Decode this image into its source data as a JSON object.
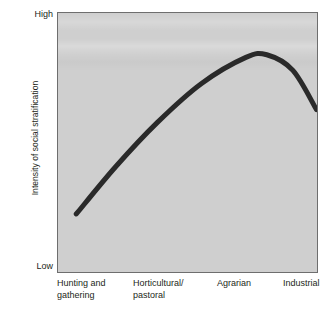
{
  "chart_data": {
    "type": "line",
    "title": "",
    "subtitle": "",
    "xlabel": "",
    "ylabel": "Intensity of social stratification",
    "categories": [
      "Hunting and\ngathering",
      "Horticultural/\npastoral",
      "Agrarian",
      "Industrial"
    ],
    "category_labels_flat": [
      "Hunting and gathering",
      "Horticultural/pastoral",
      "Agrarian",
      "Industrial"
    ],
    "y_tick_labels": [
      "High",
      "Low"
    ],
    "ylim_labels": {
      "min": "Low",
      "max": "High"
    },
    "grid": false,
    "legend": null,
    "legend_position": "none",
    "series": [
      {
        "name": "Intensity of social stratification",
        "description": "Inverted-U curve: rises steeply from hunting and gathering, peaks just past agrarian, then declines into industrial",
        "x": [
          "Hunting and gathering",
          "Horticultural/pastoral",
          "Agrarian",
          "Industrial"
        ],
        "values": [
          0.22,
          0.62,
          0.85,
          0.64
        ],
        "points": [
          {
            "x": 0.07,
            "y": 0.23
          },
          {
            "x": 0.22,
            "y": 0.41
          },
          {
            "x": 0.38,
            "y": 0.58
          },
          {
            "x": 0.55,
            "y": 0.73
          },
          {
            "x": 0.72,
            "y": 0.83
          },
          {
            "x": 0.8,
            "y": 0.84
          },
          {
            "x": 0.9,
            "y": 0.78
          },
          {
            "x": 0.99,
            "y": 0.63
          }
        ],
        "color": "#2a2a2a",
        "line_width_px": 5
      }
    ],
    "plot_background_color": "#cfcfcf",
    "figure_background_color": "#ffffff",
    "axis_border_color": "#6e6e6e",
    "text_color": "#231f20"
  }
}
